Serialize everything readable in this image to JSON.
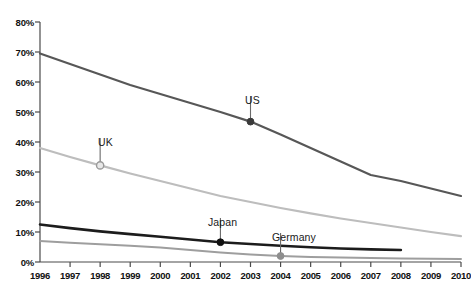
{
  "title_partial": "",
  "chart_data": {
    "type": "line",
    "title": "",
    "xlabel": "",
    "ylabel": "",
    "x": [
      1996,
      1997,
      1998,
      1999,
      2000,
      2001,
      2002,
      2003,
      2004,
      2005,
      2006,
      2007,
      2008,
      2009,
      2010
    ],
    "xlim": [
      1996,
      2010
    ],
    "ylim": [
      0,
      80
    ],
    "ytick_labels": [
      "0%",
      "10%",
      "20%",
      "30%",
      "40%",
      "50%",
      "60%",
      "70%",
      "80%"
    ],
    "ytick_values": [
      0,
      10,
      20,
      30,
      40,
      50,
      60,
      70,
      80
    ],
    "xtick_labels": [
      "1996",
      "1997",
      "1998",
      "1999",
      "2000",
      "2001",
      "2002",
      "2003",
      "2004",
      "2005",
      "2006",
      "2007",
      "2008",
      "2009",
      "2010"
    ],
    "grid": false,
    "legend": "inline-annotations",
    "series": [
      {
        "name": "US",
        "color": "#575757",
        "width": 2.2,
        "x": [
          1996,
          1997,
          1998,
          1999,
          2000,
          2001,
          2002,
          2003,
          2004,
          2005,
          2006,
          2007,
          2008,
          2009,
          2010
        ],
        "values": [
          69.5,
          66.0,
          62.5,
          59.0,
          56.0,
          53.0,
          50.0,
          46.8,
          42.5,
          38.0,
          33.5,
          29.0,
          27.0,
          24.5,
          22.0
        ],
        "marker": {
          "x": 2003,
          "y": 46.8,
          "style": "filled",
          "color": "#3a3a3a"
        },
        "label": "US",
        "label_x": 245,
        "label_y": 96
      },
      {
        "name": "UK",
        "color": "#bdbdbd",
        "width": 2.2,
        "x": [
          1996,
          1997,
          1998,
          1999,
          2000,
          2001,
          2002,
          2003,
          2004,
          2005,
          2006,
          2007,
          2008,
          2009,
          2010
        ],
        "values": [
          38.0,
          35.0,
          32.2,
          29.5,
          27.0,
          24.5,
          22.0,
          20.0,
          18.0,
          16.2,
          14.5,
          13.0,
          11.5,
          10.0,
          8.6
        ],
        "marker": {
          "x": 1998,
          "y": 32.2,
          "style": "hollow",
          "color": "#9a9a9a"
        },
        "label": "UK",
        "label_x": 98,
        "label_y": 138
      },
      {
        "name": "Japan",
        "color": "#1c1c1c",
        "width": 2.6,
        "x": [
          1996,
          1997,
          1998,
          1999,
          2000,
          2001,
          2002,
          2003,
          2004,
          2005,
          2006,
          2007,
          2008
        ],
        "values": [
          12.5,
          11.3,
          10.2,
          9.3,
          8.4,
          7.5,
          6.6,
          6.0,
          5.4,
          4.9,
          4.5,
          4.2,
          4.0
        ],
        "marker": {
          "x": 2002,
          "y": 6.6,
          "style": "filled",
          "color": "#111111"
        },
        "label": "Japan",
        "label_x": 208,
        "label_y": 218
      },
      {
        "name": "Germany",
        "color": "#9e9e9e",
        "width": 2.0,
        "x": [
          1996,
          1997,
          1998,
          1999,
          2000,
          2001,
          2002,
          2003,
          2004,
          2005,
          2006,
          2007,
          2008,
          2009,
          2010
        ],
        "values": [
          7.0,
          6.4,
          5.9,
          5.4,
          4.8,
          4.0,
          3.2,
          2.5,
          2.0,
          1.7,
          1.5,
          1.3,
          1.2,
          1.1,
          1.0
        ],
        "marker": {
          "x": 2004,
          "y": 2.0,
          "style": "filled",
          "color": "#8e8e8e"
        },
        "label": "Germany",
        "label_x": 272,
        "label_y": 233
      }
    ]
  }
}
